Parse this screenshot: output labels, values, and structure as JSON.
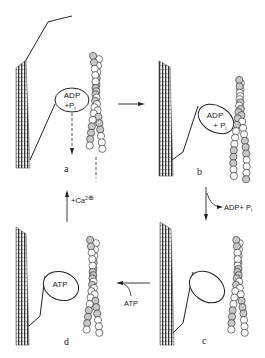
{
  "figure": {
    "type": "cross-bridge cycle (myosin-actin)",
    "colors": {
      "line": "#222222",
      "filament_hatch": "#333333",
      "actin_shaded": "#c8c8c8",
      "actin_plain": "#ffffff",
      "background": "#ffffff"
    }
  },
  "panels": {
    "a": {
      "label": "a",
      "head_text_line1": "ADP",
      "head_text_line2": "+P",
      "head_text_sub": "i"
    },
    "b": {
      "label": "b",
      "head_text_line1": "ADP",
      "head_text_line2": "+ P",
      "head_text_sub": "i"
    },
    "c": {
      "label": "c"
    },
    "d": {
      "label": "d",
      "head_text": "ATP"
    }
  },
  "transitions": {
    "a_to_b": {
      "label": ""
    },
    "b_to_c": {
      "label": "ADP+ P",
      "sub": "i"
    },
    "c_to_d": {
      "label": "ATP"
    },
    "d_to_a": {
      "label": "+Ca",
      "sup": "2",
      "charge": "⊕"
    }
  }
}
